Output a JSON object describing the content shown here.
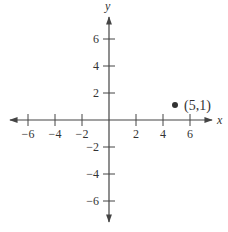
{
  "chart_data": {
    "type": "scatter",
    "title": "",
    "xlabel": "x",
    "ylabel": "y",
    "xlim": [
      -7,
      7
    ],
    "ylim": [
      -7,
      7
    ],
    "grid": false,
    "legend": null,
    "x_ticks": [
      -6,
      -4,
      -2,
      2,
      4,
      6
    ],
    "y_ticks": [
      6,
      4,
      2,
      -2,
      -4,
      -6
    ],
    "x_tick_labels": [
      "−6",
      "−4",
      "−2",
      "2",
      "4",
      "6"
    ],
    "y_tick_labels": [
      "6",
      "4",
      "2",
      "−2",
      "−4",
      "−6"
    ],
    "series": [
      {
        "name": "point",
        "points": [
          {
            "x": 5,
            "y": 1,
            "label": "(5,1)"
          }
        ],
        "color": "#333333"
      }
    ],
    "annotations": [
      "(5,1)"
    ]
  },
  "axes": {
    "x_label": "x",
    "y_label": "y",
    "origin_px": {
      "x": 109,
      "y": 120
    },
    "unit_px": 13.5,
    "color": "#444444"
  }
}
